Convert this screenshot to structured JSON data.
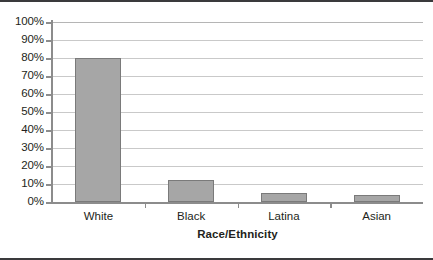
{
  "chart_data": {
    "type": "bar",
    "title": "",
    "xlabel": "Race/Ethnicity",
    "ylabel": "",
    "categories": [
      "White",
      "Black",
      "Latina",
      "Asian"
    ],
    "values": [
      80,
      12,
      5,
      4
    ],
    "ylim": [
      0,
      100
    ],
    "ytick_labels": [
      "0%",
      "10%",
      "20%",
      "30%",
      "40%",
      "50%",
      "60%",
      "70%",
      "80%",
      "90%",
      "100%"
    ],
    "ytick_values": [
      0,
      10,
      20,
      30,
      40,
      50,
      60,
      70,
      80,
      90,
      100
    ],
    "grid": "horizontal",
    "legend": "none",
    "series": [
      {
        "name": "",
        "values": [
          80,
          12,
          5,
          4
        ]
      }
    ],
    "colors": {
      "bar_fill": "#a6a6a6",
      "bar_border": "#7a7a7a",
      "gridline": "#c9c9c9",
      "axis": "#8c8c8c",
      "text": "#231f20",
      "frame_rule": "#3a3a3c",
      "background": "#ffffff"
    }
  }
}
